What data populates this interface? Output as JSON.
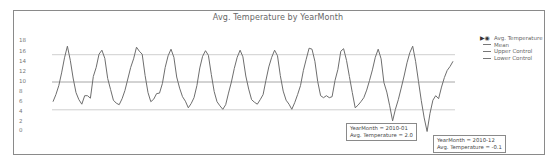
{
  "chart_data": {
    "type": "line",
    "title": "Avg. Temperature by YearMonth",
    "xlabel": "YearMonth",
    "ylabel": "Avg. Temperature",
    "ylim": [
      0,
      18
    ],
    "yticks": [
      18,
      16,
      14,
      12,
      10,
      8,
      6,
      4,
      2,
      0
    ],
    "grid": false,
    "legend_position": "right",
    "series": [
      {
        "name": "Avg. Temperature",
        "values": [
          5.8,
          7.2,
          9.0,
          11.5,
          14.5,
          16.8,
          14.0,
          10.5,
          7.6,
          6.2,
          5.3,
          7.0,
          7.0,
          6.5,
          10.8,
          12.6,
          15.2,
          16.0,
          14.4,
          10.4,
          8.2,
          6.1,
          5.5,
          5.2,
          6.4,
          8.0,
          10.3,
          12.6,
          14.3,
          16.6,
          15.8,
          15.2,
          11.0,
          7.6,
          5.8,
          6.3,
          7.4,
          7.5,
          9.4,
          12.6,
          14.9,
          16.2,
          14.6,
          10.7,
          8.5,
          6.8,
          5.9,
          4.6,
          5.4,
          6.6,
          9.0,
          12.5,
          14.8,
          15.9,
          15.0,
          11.2,
          7.8,
          5.8,
          5.0,
          4.3,
          5.2,
          7.5,
          9.7,
          12.4,
          14.6,
          16.0,
          14.7,
          10.9,
          8.3,
          6.2,
          5.7,
          5.3,
          6.2,
          7.2,
          10.0,
          12.7,
          14.6,
          16.0,
          14.9,
          11.0,
          7.9,
          6.1,
          5.3,
          4.3,
          5.6,
          7.2,
          9.0,
          12.0,
          14.2,
          16.4,
          16.2,
          13.8,
          9.8,
          7.0,
          6.6,
          7.0,
          6.6,
          6.8,
          10.0,
          12.2,
          15.8,
          16.3,
          14.0,
          10.8,
          7.6,
          4.6,
          5.1,
          5.8,
          6.6,
          8.1,
          10.0,
          12.1,
          14.6,
          16.2,
          14.3,
          9.6,
          7.7,
          5.0,
          2.0,
          4.3,
          6.2,
          8.5,
          10.9,
          13.5,
          15.5,
          16.8,
          13.8,
          9.8,
          6.0,
          2.6,
          -0.1,
          3.5,
          6.1,
          7.0,
          6.4,
          8.7,
          10.6,
          12.0,
          12.8,
          13.8
        ]
      },
      {
        "name": "Mean",
        "values": [
          9.7
        ]
      },
      {
        "name": "Upper Control",
        "values": [
          15.1
        ]
      },
      {
        "name": "Lower Control",
        "values": [
          4.2
        ]
      }
    ],
    "annotations": [
      {
        "label": "YearMonth = 2010-01",
        "value_label": "Avg. Temperature = 2.0"
      },
      {
        "label": "YearMonth = 2010-12",
        "value_label": "Avg. Temperature = -0.1"
      }
    ]
  },
  "chart": {
    "title": "Avg. Temperature by YearMonth",
    "yticks": [
      "18",
      "16",
      "14",
      "12",
      "10",
      "8",
      "6",
      "4",
      "2",
      "0"
    ],
    "legend": {
      "items": [
        "Avg. Temperature",
        "Mean",
        "Upper Control",
        "Lower Control"
      ]
    },
    "tooltips": [
      {
        "line1": "YearMonth = 2010-01",
        "line2": "Avg. Temperature = 2.0"
      },
      {
        "line1": "YearMonth = 2010-12",
        "line2": "Avg. Temperature = -0.1"
      }
    ]
  },
  "colors": {
    "line": "#6e6e6e",
    "mean": "#a6a6a6",
    "control": "#cfcfcf",
    "frame": "#8a8a8a"
  }
}
